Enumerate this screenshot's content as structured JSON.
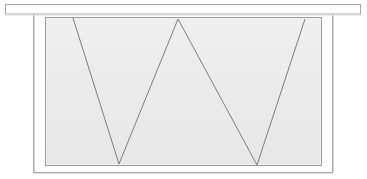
{
  "canvas": {
    "width": 367,
    "height": 179,
    "background_color": "#ffffff"
  },
  "diagram": {
    "stroke_color": "#9a9a9a",
    "stroke_color_dark": "#8a8a8a",
    "zigzag_color": "#7d7d7d",
    "panel_fill_color": "#ececec",
    "panel_fill_color_alt": "#e8e8e8",
    "white_fill": "#ffffff",
    "stroke_width": 1,
    "zigzag_stroke_width": 1
  },
  "parts": {
    "top_flange": {
      "label": "top-flange-bar",
      "x": 5,
      "y": 4,
      "width": 356,
      "height": 10,
      "fill": "#ffffff",
      "stroke": "#a6a6a6"
    },
    "left_stem": {
      "label": "left-vertical-stem",
      "x": 33,
      "y_top": 14,
      "y_bottom": 172
    },
    "right_stem": {
      "label": "right-vertical-stem",
      "x": 333,
      "y_top": 14,
      "y_bottom": 172
    },
    "bottom_rail": {
      "label": "bottom-rail-line",
      "x_start": 33,
      "x_end": 333,
      "y": 172
    },
    "web_panel": {
      "label": "shaded-web-panel",
      "x": 45,
      "y": 17,
      "width": 277,
      "height": 149,
      "fill": "#ececec",
      "stroke": "#9a9a9a"
    }
  },
  "chart_data": {
    "type": "line",
    "xlabel": "",
    "ylabel": "",
    "xlim": [
      45,
      322
    ],
    "ylim": [
      17,
      166
    ],
    "grid": false,
    "legend": "none",
    "series": [
      {
        "name": "zigzag-bracing",
        "points": [
          {
            "x": 73,
            "y": 18
          },
          {
            "x": 119,
            "y": 164
          },
          {
            "x": 178,
            "y": 19
          },
          {
            "x": 257,
            "y": 165
          },
          {
            "x": 305,
            "y": 19
          }
        ]
      }
    ],
    "vertices": [
      {
        "name": "start-top-left",
        "x": 73,
        "y": 18,
        "kind": "top"
      },
      {
        "name": "valley-left",
        "x": 119,
        "y": 164,
        "kind": "bottom"
      },
      {
        "name": "peak-center",
        "x": 178,
        "y": 19,
        "kind": "top"
      },
      {
        "name": "valley-right",
        "x": 257,
        "y": 165,
        "kind": "bottom"
      },
      {
        "name": "end-top-right",
        "x": 305,
        "y": 19,
        "kind": "top"
      }
    ]
  }
}
